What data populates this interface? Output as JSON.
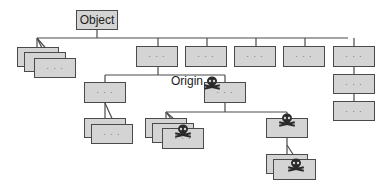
{
  "diagram": {
    "root_label": "Object",
    "origin_label": "Origin",
    "ellipsis": "· · ·",
    "colors": {
      "node_fill": "#d4d4d4",
      "node_border": "#4a4a4a",
      "line": "#4a4a4a",
      "skull": "#2a2a2a"
    },
    "nodes": [
      {
        "id": "root",
        "label": "Object"
      },
      {
        "id": "stack-left",
        "label": "· · ·"
      },
      {
        "id": "c1",
        "label": "· · ·"
      },
      {
        "id": "c2",
        "label": "· · ·"
      },
      {
        "id": "c3",
        "label": "· · ·"
      },
      {
        "id": "c4",
        "label": "· · ·"
      },
      {
        "id": "c5",
        "label": "· · ·"
      },
      {
        "id": "c5-child1",
        "label": "· · ·"
      },
      {
        "id": "c5-child2",
        "label": "· · ·"
      },
      {
        "id": "c1-left",
        "label": "· · ·"
      },
      {
        "id": "origin",
        "label": "· · ·",
        "marked": true
      },
      {
        "id": "c1-left-stack",
        "label": "· · ·"
      },
      {
        "id": "origin-stack",
        "label": "· · ·",
        "marked": true
      },
      {
        "id": "origin-right",
        "label": "",
        "marked": true
      },
      {
        "id": "origin-right-stack",
        "label": "",
        "marked": true
      }
    ]
  }
}
